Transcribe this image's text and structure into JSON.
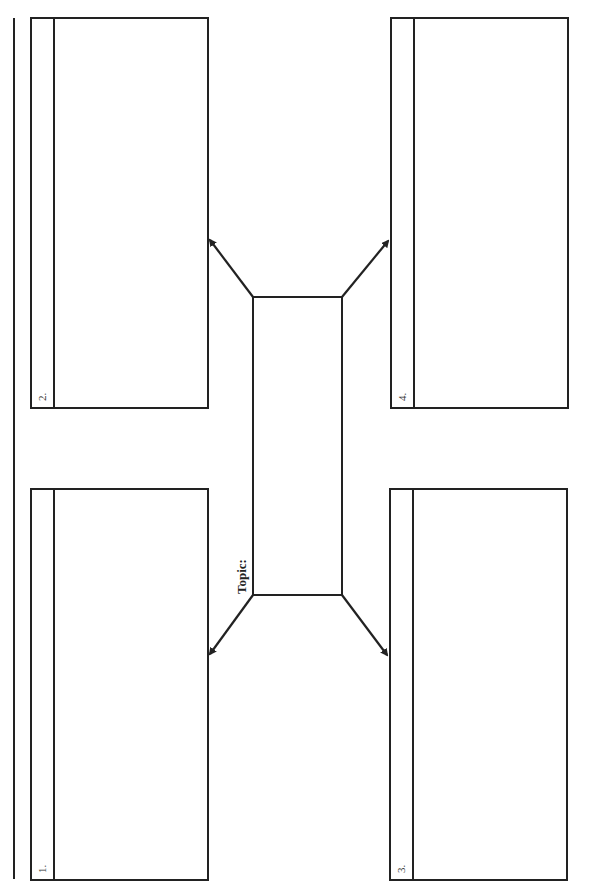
{
  "document": {
    "type": "graphic-organizer",
    "orientation": "rotated-90-ccw",
    "colors": {
      "line": "#222222",
      "background": "#ffffff",
      "text": "#222222"
    }
  },
  "center": {
    "label": "Topic:",
    "value": ""
  },
  "boxes": [
    {
      "number": "1.",
      "content": ""
    },
    {
      "number": "2.",
      "content": ""
    },
    {
      "number": "3.",
      "content": ""
    },
    {
      "number": "4.",
      "content": ""
    }
  ]
}
